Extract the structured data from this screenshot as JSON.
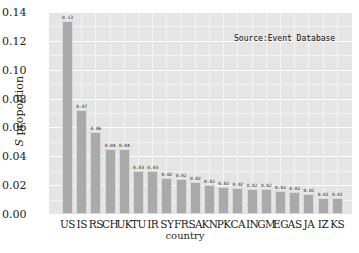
{
  "chart_data": {
    "type": "bar",
    "title": "",
    "annotation": "Source:Event Database",
    "xlabel": "country",
    "ylabel": "S proportion",
    "ylabel_italic_prefix": "S",
    "ylabel_rest": " proportion",
    "ylim": [
      0,
      0.14
    ],
    "yticks": [
      "0.00",
      "0.02",
      "0.04",
      "0.06",
      "0.08",
      "0.10",
      "0.12",
      "0.14"
    ],
    "grid": true,
    "legend": null,
    "categories": [
      "US",
      "IS",
      "RS",
      "CH",
      "UK",
      "TU",
      "IR",
      "SY",
      "FR",
      "SA",
      "KN",
      "PK",
      "CA",
      "IN",
      "GM",
      "EG",
      "AS",
      "JA",
      "IZ",
      "KS"
    ],
    "values": [
      0.134,
      0.072,
      0.057,
      0.045,
      0.045,
      0.03,
      0.03,
      0.025,
      0.024,
      0.022,
      0.02,
      0.019,
      0.018,
      0.017,
      0.017,
      0.016,
      0.015,
      0.014,
      0.011,
      0.011
    ],
    "data_labels": [
      "0.13",
      "0.07",
      "0.06",
      "0.04",
      "0.04",
      "0.03",
      "0.03",
      "0.02",
      "0.02",
      "0.02",
      "0.02",
      "0.02",
      "0.02",
      "0.02",
      "0.02",
      "0.02",
      "0.02",
      "0.01",
      "0.01",
      "0.01"
    ],
    "colors": {
      "bar": "#aaaaaa",
      "background": "#e5e5e5",
      "grid": "#ffffff"
    }
  }
}
